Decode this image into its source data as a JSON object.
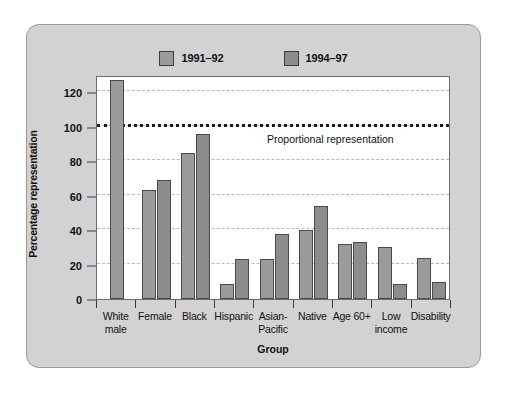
{
  "legend": {
    "position": "top-center",
    "entries": [
      {
        "label": "1991–92",
        "color": "#9b9b9b",
        "icon": "legend-swatch"
      },
      {
        "label": "1994–97",
        "color": "#8c8c8c",
        "icon": "legend-swatch"
      }
    ]
  },
  "annotation": {
    "reference_label": "Proportional representation",
    "reference_value": 100
  },
  "axes": {
    "ylabel": "Percentage representation",
    "xlabel": "Group",
    "yticks": [
      0,
      20,
      40,
      60,
      80,
      100,
      120
    ]
  },
  "colors": {
    "panel_background": "#d2d2d2",
    "plot_background": "#ffffff",
    "series1": "#9b9b9b",
    "series2": "#8c8c8c",
    "bar_edge": "#4a4a4a",
    "gridline": "#b9b9b9",
    "reference_line": "#1c1c1c",
    "axis": "#3a3a3a"
  },
  "chart_data": {
    "type": "bar",
    "title": "",
    "subtitle": "",
    "xlabel": "Group",
    "ylabel": "Percentage representation",
    "ylim": [
      0,
      130
    ],
    "yticks": [
      0,
      20,
      40,
      60,
      80,
      100,
      120
    ],
    "grid": true,
    "legend_position": "top-center",
    "categories": [
      "White male",
      "Female",
      "Black",
      "Hispanic",
      "Asian-Pacific",
      "Native",
      "Age 60+",
      "Low income",
      "Disability"
    ],
    "category_lines": [
      [
        "White",
        "male"
      ],
      [
        "Female"
      ],
      [
        "Black"
      ],
      [
        "Hispanic"
      ],
      [
        "Asian-",
        "Pacific"
      ],
      [
        "Native"
      ],
      [
        "Age 60+"
      ],
      [
        "Low",
        "income"
      ],
      [
        "Disability"
      ]
    ],
    "series": [
      {
        "name": "1991–92",
        "color": "#9b9b9b",
        "values": [
          127,
          63,
          85,
          9,
          23,
          40,
          32,
          30,
          24
        ]
      },
      {
        "name": "1994–97",
        "color": "#8c8c8c",
        "values": [
          null,
          69,
          96,
          23,
          38,
          54,
          33,
          9,
          10
        ]
      }
    ],
    "annotations": [
      {
        "type": "hline",
        "value": 100,
        "label": "Proportional representation",
        "style": "dotted"
      }
    ]
  }
}
